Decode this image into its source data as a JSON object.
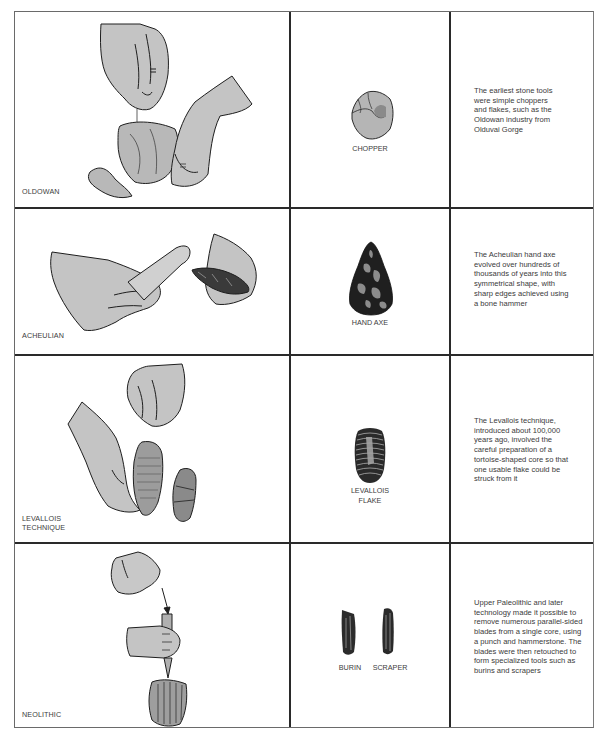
{
  "rows": [
    {
      "technique_label": [
        "OLDOWAN"
      ],
      "tool_labels": [
        "CHOPPER"
      ],
      "description_lines": [
        "The earliest stone tools",
        "were simple choppers",
        "and flakes, such as the",
        "Oldowan industry from",
        "Olduvai Gorge"
      ],
      "illustration": "hands-striking-stone-icon",
      "tool_icon": "chopper-icon"
    },
    {
      "technique_label": [
        "ACHEULIAN"
      ],
      "tool_labels": [
        "HAND AXE"
      ],
      "description_lines": [
        "The Acheulian hand axe",
        "evolved over hundreds of",
        "thousands of years into this",
        "symmetrical shape, with",
        "sharp edges achieved using",
        "a bone hammer"
      ],
      "illustration": "hands-bone-hammer-icon",
      "tool_icon": "hand-axe-icon"
    },
    {
      "technique_label": [
        "LEVALLOIS",
        "TECHNIQUE"
      ],
      "tool_labels": [
        "LEVALLOIS",
        "FLAKE"
      ],
      "description_lines": [
        "The Levallois technique,",
        "introduced about 100,000",
        "years ago, involved the",
        "careful preparation of a",
        "tortoise-shaped core so that",
        "one usable flake could be",
        "struck from it"
      ],
      "illustration": "hands-prepared-core-icon",
      "tool_icon": "levallois-flake-icon"
    },
    {
      "technique_label": [
        "NEOLITHIC"
      ],
      "tool_labels": [
        "BURIN",
        "SCRAPER"
      ],
      "description_lines": [
        "Upper Paleolithic and later",
        "technology made it possible to",
        "remove numerous parallel-sided",
        "blades from a single core, using",
        "a punch and hammerstone. The",
        "blades were then retouched to",
        "form specialized tools such as",
        "burins and scrapers"
      ],
      "illustration": "hands-punch-blade-core-icon",
      "tool_icon": "burin-scraper-icon"
    }
  ],
  "colors": {
    "border": "#2a2a2a",
    "skin_fill": "#c4c4c4",
    "ink": "#1e1e1e",
    "text": "#3a3a3a"
  }
}
